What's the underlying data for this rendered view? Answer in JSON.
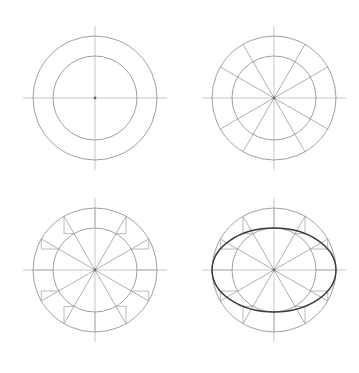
{
  "figure": {
    "canvas_width": 359,
    "canvas_height": 373,
    "background_color": "#ffffff",
    "line_color_light": "#b9b9c0",
    "line_color_circle": "#8e8e99",
    "line_color_spoke": "#9a9aa4",
    "line_color_construction": "#a8a8b2",
    "line_color_ellipse": "#3a3a44"
  },
  "geometry": {
    "outer_radius": 62,
    "inner_radius": 42,
    "axis_overhang": 10,
    "spoke_count": 12,
    "spoke_angle_step_degrees": 30,
    "spoke_angles_degrees": [
      0,
      30,
      60,
      90,
      120,
      150,
      180,
      210,
      240,
      270,
      300,
      330
    ],
    "ellipse_semi_major": 62,
    "ellipse_semi_minor": 42,
    "ellipse_rotation_degrees": 0
  },
  "panels": [
    {
      "id": "panel-1",
      "step_number": "1",
      "caption": "",
      "center_x": 95,
      "center_y": 98,
      "show_circles": true,
      "show_axes": true,
      "show_spokes": false,
      "show_construction": false,
      "show_ellipse": false
    },
    {
      "id": "panel-2",
      "step_number": "2",
      "caption": "",
      "center_x": 274,
      "center_y": 98,
      "show_circles": true,
      "show_axes": true,
      "show_spokes": true,
      "show_construction": false,
      "show_ellipse": false
    },
    {
      "id": "panel-3",
      "step_number": "3",
      "caption": "",
      "center_x": 95,
      "center_y": 270,
      "show_circles": true,
      "show_axes": true,
      "show_spokes": true,
      "show_construction": true,
      "show_ellipse": false
    },
    {
      "id": "panel-4",
      "step_number": "4",
      "caption": "",
      "center_x": 274,
      "center_y": 270,
      "show_circles": true,
      "show_axes": true,
      "show_spokes": true,
      "show_construction": true,
      "show_ellipse": true
    }
  ]
}
